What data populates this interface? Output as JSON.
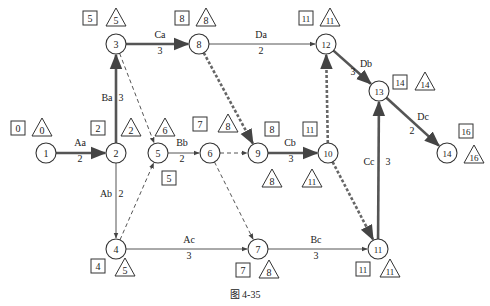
{
  "caption": "图  4-35",
  "nodes": [
    {
      "id": "1",
      "x": 46,
      "y": 153,
      "es": "0",
      "ls": "0",
      "es_pos": [
        18,
        129
      ],
      "ls_pos": [
        42,
        129
      ]
    },
    {
      "id": "2",
      "x": 116,
      "y": 153,
      "es": "2",
      "ls": "2",
      "es_pos": [
        98,
        129
      ],
      "ls_pos": [
        131,
        129
      ]
    },
    {
      "id": "3",
      "x": 116,
      "y": 44,
      "es": "5",
      "ls": "5",
      "es_pos": [
        90,
        19
      ],
      "ls_pos": [
        116,
        19
      ]
    },
    {
      "id": "4",
      "x": 116,
      "y": 249,
      "es": "4",
      "ls": "5",
      "es_pos": [
        98,
        267
      ],
      "ls_pos": [
        125,
        269
      ]
    },
    {
      "id": "5",
      "x": 158,
      "y": 153,
      "es": "5",
      "ls": "6",
      "es_pos": [
        169,
        179
      ],
      "ls_pos": [
        165,
        129
      ]
    },
    {
      "id": "6",
      "x": 210,
      "y": 153,
      "es": "7",
      "ls": "8",
      "es_pos": [
        200,
        125
      ],
      "ls_pos": [
        228,
        125
      ]
    },
    {
      "id": "8",
      "x": 199,
      "y": 44,
      "es": "8",
      "ls": "8",
      "es_pos": [
        182,
        19
      ],
      "ls_pos": [
        206,
        19
      ]
    },
    {
      "id": "9",
      "x": 258,
      "y": 153,
      "es": "8",
      "ls": "8",
      "es_pos": [
        272,
        130
      ],
      "ls_pos": [
        272,
        180
      ]
    },
    {
      "id": "10",
      "x": 328,
      "y": 153,
      "es": "11",
      "ls": "11",
      "es_pos": [
        310,
        130
      ],
      "ls_pos": [
        312,
        180
      ]
    },
    {
      "id": "7",
      "x": 258,
      "y": 249,
      "es": "7",
      "ls": "8",
      "es_pos": [
        243,
        271
      ],
      "ls_pos": [
        269,
        271
      ]
    },
    {
      "id": "11",
      "x": 378,
      "y": 249,
      "es": "11",
      "ls": "11",
      "es_pos": [
        363,
        270
      ],
      "ls_pos": [
        390,
        270
      ]
    },
    {
      "id": "12",
      "x": 326,
      "y": 44,
      "es": "11",
      "ls": "11",
      "es_pos": [
        306,
        19
      ],
      "ls_pos": [
        330,
        19
      ]
    },
    {
      "id": "13",
      "x": 379,
      "y": 91,
      "es": "14",
      "ls": "14",
      "es_pos": [
        400,
        83
      ],
      "ls_pos": [
        425,
        83
      ]
    },
    {
      "id": "14",
      "x": 447,
      "y": 153,
      "es": "16",
      "ls": "16",
      "es_pos": [
        466,
        132
      ],
      "ls_pos": [
        474,
        156
      ]
    }
  ],
  "activities": [
    {
      "name": "Aa",
      "duration": "2",
      "from": "1",
      "to": "2",
      "type": "critical",
      "name_pos": [
        80,
        146
      ],
      "dur_pos": [
        80,
        162
      ]
    },
    {
      "name": "Ba",
      "duration": "3",
      "from": "2",
      "to": "3",
      "type": "critical",
      "name_pos": [
        107,
        101
      ],
      "dur_pos": [
        121,
        101
      ]
    },
    {
      "name": "Ca",
      "duration": "3",
      "from": "3",
      "to": "8",
      "type": "critical",
      "name_pos": [
        160,
        38
      ],
      "dur_pos": [
        160,
        54
      ]
    },
    {
      "name": "Da",
      "duration": "2",
      "from": "8",
      "to": "12",
      "type": "normal",
      "name_pos": [
        261,
        38
      ],
      "dur_pos": [
        261,
        54
      ]
    },
    {
      "name": "Ab",
      "duration": "2",
      "from": "2",
      "to": "4",
      "type": "normal",
      "name_pos": [
        106,
        197
      ],
      "dur_pos": [
        121,
        197
      ]
    },
    {
      "name": "Bb",
      "duration": "2",
      "from": "5",
      "to": "6",
      "type": "normal",
      "name_pos": [
        182,
        146
      ],
      "dur_pos": [
        182,
        162
      ]
    },
    {
      "name": "Cb",
      "duration": "3",
      "from": "9",
      "to": "10",
      "type": "critical",
      "name_pos": [
        290,
        146
      ],
      "dur_pos": [
        291,
        162
      ]
    },
    {
      "name": "Ac",
      "duration": "3",
      "from": "4",
      "to": "7",
      "type": "normal",
      "name_pos": [
        189,
        243
      ],
      "dur_pos": [
        189,
        259
      ]
    },
    {
      "name": "Bc",
      "duration": "3",
      "from": "7",
      "to": "11",
      "type": "normal",
      "name_pos": [
        316,
        243
      ],
      "dur_pos": [
        316,
        259
      ]
    },
    {
      "name": "Cc",
      "duration": "3",
      "from": "11",
      "to": "13",
      "type": "critical",
      "name_pos": [
        369,
        165
      ],
      "dur_pos": [
        388,
        165
      ]
    },
    {
      "name": "Db",
      "duration": "3",
      "from": "12",
      "to": "13",
      "type": "critical",
      "name_pos": [
        366,
        67
      ],
      "dur_pos": [
        353,
        75
      ]
    },
    {
      "name": "Dc",
      "duration": "2",
      "from": "13",
      "to": "14",
      "type": "critical",
      "name_pos": [
        423,
        120
      ],
      "dur_pos": [
        412,
        134
      ]
    }
  ],
  "dummies": [
    {
      "from": "3",
      "to": "5",
      "type": "dashed"
    },
    {
      "from": "4",
      "to": "5",
      "type": "dashed"
    },
    {
      "from": "6",
      "to": "9",
      "type": "dashed"
    },
    {
      "from": "6",
      "to": "7",
      "type": "dashed"
    },
    {
      "from": "8",
      "to": "9",
      "type": "critical-dashed"
    },
    {
      "from": "10",
      "to": "12",
      "type": "critical-dashed"
    },
    {
      "from": "10",
      "to": "11",
      "type": "critical-dashed"
    }
  ],
  "legend": {
    "square": "earliest start time",
    "triangle": "latest start time"
  }
}
